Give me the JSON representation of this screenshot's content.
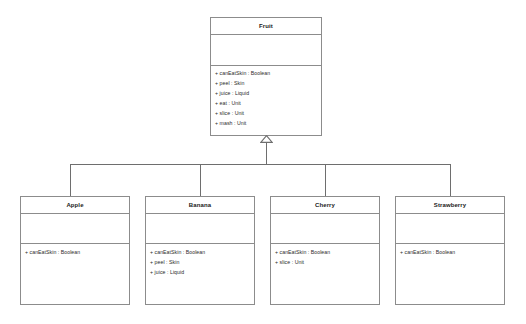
{
  "diagram": {
    "type": "uml-class-diagram",
    "relationship": "generalization",
    "background_color": "#ffffff",
    "border_color": "#8c8c8c",
    "line_color": "#6e6e6e",
    "text_color": "#1a1a1a"
  },
  "superclass": {
    "name": "Fruit",
    "attributes": [],
    "operations": [
      "+ canEatSkin : Boolean",
      "+ peel : Skin",
      "+ juice : Liquid",
      "+ eat : Unit",
      "+ slice : Unit",
      "+ mash : Unit"
    ]
  },
  "subclasses": [
    {
      "name": "Apple",
      "attributes": [],
      "operations": [
        "+ canEatSkin : Boolean"
      ]
    },
    {
      "name": "Banana",
      "attributes": [],
      "operations": [
        "+ canEatSkin : Boolean",
        "+ peel : Skin",
        "+ juice : Liquid"
      ]
    },
    {
      "name": "Cherry",
      "attributes": [],
      "operations": [
        "+ canEatSkin : Boolean",
        "+ slice : Unit"
      ]
    },
    {
      "name": "Strawberry",
      "attributes": [],
      "operations": [
        "+ canEatSkin : Boolean"
      ]
    }
  ]
}
